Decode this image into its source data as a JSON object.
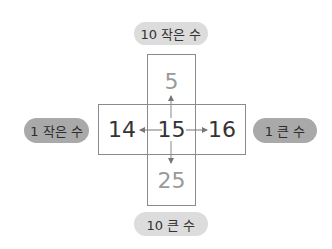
{
  "diagram": {
    "center": "15",
    "top": {
      "value": "5",
      "label": "10 작은 수"
    },
    "bottom": {
      "value": "25",
      "label": "10 큰 수"
    },
    "left": {
      "value": "14",
      "label": "1 작은 수"
    },
    "right": {
      "value": "16",
      "label": "1 큰 수"
    }
  },
  "colors": {
    "label_light_bg": "#dcdcdc",
    "label_dark_bg": "#a9a9a9",
    "border": "#8a8a8a",
    "muted_number": "#9a9a9a",
    "dark_number": "#333333",
    "arrow": "#777777"
  }
}
